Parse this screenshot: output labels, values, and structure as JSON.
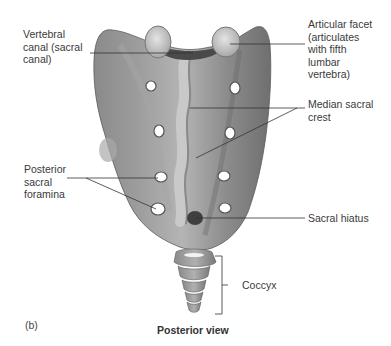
{
  "figure": {
    "panel_letter": "(b)",
    "caption": "Posterior view",
    "labels": {
      "vertebral_canal": "Vertebral\ncanal (sacral\ncanal)",
      "articular_facet": "Articular facet\n(articulates\nwith fifth\nlumbar\nvertebra)",
      "median_sacral_crest": "Median sacral\ncrest",
      "posterior_sacral_foramina": "Posterior\nsacral\nforamina",
      "sacral_hiatus": "Sacral hiatus",
      "coccyx": "Coccyx"
    },
    "colors": {
      "bone_dark": "#6e6e6e",
      "bone_mid": "#8f8f8f",
      "bone_light": "#c8c8c8",
      "leader_line": "#333333",
      "background": "#ffffff"
    }
  }
}
